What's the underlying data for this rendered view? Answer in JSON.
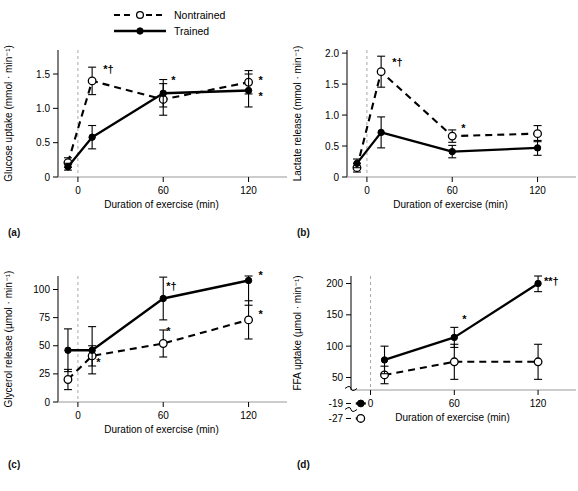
{
  "figure": {
    "legend": {
      "entries": [
        {
          "label": "Nontrained",
          "style": "dashed",
          "marker": "open-circle"
        },
        {
          "label": "Trained",
          "style": "solid",
          "marker": "filled-circle"
        }
      ]
    },
    "panel_labels": {
      "a": "(a)",
      "b": "(b)",
      "c": "(c)",
      "d": "(d)"
    }
  },
  "chart_data": [
    {
      "id": "a",
      "type": "line",
      "title": "",
      "xlabel": "Duration of exercise (min)",
      "ylabel": "Glucose uptake (mmol · min⁻¹)",
      "xticks": [
        0,
        60,
        120
      ],
      "xticklabels": [
        "0",
        "60",
        "120"
      ],
      "yticks": [
        0,
        0.5,
        1.0,
        1.5
      ],
      "yticklabels": [
        "0",
        "0.5",
        "1.0",
        "1.5"
      ],
      "ylim": [
        0,
        1.85
      ],
      "xlim": [
        -14,
        140
      ],
      "grid": false,
      "legend_position": "top-center-figure",
      "series": [
        {
          "name": "Nontrained",
          "style": "dashed",
          "marker": "open-circle",
          "x": [
            -7,
            10,
            60,
            120
          ],
          "values": [
            0.21,
            1.4,
            1.13,
            1.38
          ],
          "err": [
            0.07,
            0.2,
            0.23,
            0.17
          ]
        },
        {
          "name": "Trained",
          "style": "solid",
          "marker": "filled-circle",
          "x": [
            -7,
            10,
            60,
            120
          ],
          "values": [
            0.15,
            0.58,
            1.22,
            1.26
          ],
          "err": [
            0.05,
            0.17,
            0.2,
            0.24
          ]
        }
      ],
      "annotations": [
        {
          "text": "*†",
          "x": 10,
          "y": 1.4,
          "dx": 11,
          "dy": -8
        },
        {
          "text": "*",
          "x": 60,
          "y": 1.22,
          "dx": 8,
          "dy": -9
        },
        {
          "text": "*",
          "x": 120,
          "y": 1.38,
          "dx": 10,
          "dy": 2
        },
        {
          "text": "*",
          "x": 120,
          "y": 1.26,
          "dx": 10,
          "dy": 9
        }
      ]
    },
    {
      "id": "b",
      "type": "line",
      "title": "",
      "xlabel": "Duration of exercise (min)",
      "ylabel": "Lactate release (mmol · min⁻¹)",
      "xticks": [
        0,
        60,
        120
      ],
      "xticklabels": [
        "0",
        "60",
        "120"
      ],
      "yticks": [
        0,
        0.5,
        1.0,
        1.5,
        2.0
      ],
      "yticklabels": [
        "0",
        "0.5",
        "1.0",
        "1.5",
        "2.0"
      ],
      "ylim": [
        0,
        2.05
      ],
      "xlim": [
        -14,
        140
      ],
      "grid": false,
      "series": [
        {
          "name": "Nontrained",
          "style": "dashed",
          "marker": "open-circle",
          "x": [
            -7,
            10,
            60,
            120
          ],
          "values": [
            0.15,
            1.7,
            0.66,
            0.7
          ],
          "err": [
            0.07,
            0.25,
            0.1,
            0.13
          ]
        },
        {
          "name": "Trained",
          "style": "solid",
          "marker": "filled-circle",
          "x": [
            -7,
            10,
            60,
            120
          ],
          "values": [
            0.22,
            0.72,
            0.41,
            0.47
          ],
          "err": [
            0.07,
            0.25,
            0.1,
            0.12
          ]
        }
      ],
      "annotations": [
        {
          "text": "*†",
          "x": 10,
          "y": 1.7,
          "dx": 11,
          "dy": -6
        },
        {
          "text": "*",
          "x": 60,
          "y": 0.66,
          "dx": 9,
          "dy": -4
        }
      ]
    },
    {
      "id": "c",
      "type": "line",
      "title": "",
      "xlabel": "Duration of exercise (min)",
      "ylabel": "Glycerol release (µmol · min⁻¹)",
      "xticks": [
        0,
        60,
        120
      ],
      "xticklabels": [
        "0",
        "60",
        "120"
      ],
      "yticks": [
        0,
        25,
        50,
        75,
        100
      ],
      "yticklabels": [
        "0",
        "25",
        "50",
        "75",
        "100"
      ],
      "ylim": [
        0,
        112
      ],
      "xlim": [
        -14,
        140
      ],
      "grid": false,
      "series": [
        {
          "name": "Nontrained",
          "style": "dashed",
          "marker": "open-circle",
          "x": [
            -7,
            10,
            60,
            120
          ],
          "values": [
            20,
            41,
            52,
            73
          ],
          "err": [
            9,
            9,
            12,
            17
          ]
        },
        {
          "name": "Trained",
          "style": "solid",
          "marker": "filled-circle",
          "x": [
            -7,
            10,
            60,
            120
          ],
          "values": [
            46,
            46,
            92,
            108
          ],
          "err": [
            19,
            21,
            19,
            22
          ]
        }
      ],
      "annotations": [
        {
          "text": "*",
          "x": 10,
          "y": 41,
          "dx": 4,
          "dy": 10
        },
        {
          "text": "*†",
          "x": 60,
          "y": 92,
          "dx": 3,
          "dy": -9
        },
        {
          "text": "*",
          "x": 60,
          "y": 52,
          "dx": 3,
          "dy": -9
        },
        {
          "text": "*",
          "x": 120,
          "y": 108,
          "dx": 10,
          "dy": -2
        },
        {
          "text": "*",
          "x": 120,
          "y": 73,
          "dx": 10,
          "dy": -2
        }
      ]
    },
    {
      "id": "d",
      "type": "line",
      "title": "",
      "xlabel": "Duration of exercise (min)",
      "ylabel": "FFA uptake (µmol · min⁻¹)",
      "xticks": [
        0,
        60,
        120
      ],
      "xticklabels": [
        "0",
        "60",
        "120"
      ],
      "yticks": [
        50,
        100,
        150,
        200
      ],
      "yticklabels": [
        "50",
        "100",
        "150",
        "200"
      ],
      "broken_axis": true,
      "broken_ticks": [
        {
          "label": "-19",
          "value": -19
        },
        {
          "label": "-27",
          "value": -27
        }
      ],
      "ylim": [
        30,
        212
      ],
      "xlim": [
        -14,
        140
      ],
      "grid": false,
      "series": [
        {
          "name": "Nontrained",
          "style": "dashed",
          "marker": "open-circle",
          "x": [
            10,
            60,
            120
          ],
          "values": [
            54,
            75,
            75
          ],
          "err": [
            14,
            28,
            28
          ]
        },
        {
          "name": "Trained",
          "style": "solid",
          "marker": "filled-circle",
          "x": [
            10,
            60,
            120
          ],
          "values": [
            78,
            114,
            200
          ],
          "err": [
            22,
            16,
            13
          ]
        }
      ],
      "basal": [
        {
          "name": "Trained",
          "marker": "filled-circle",
          "label": "-19"
        },
        {
          "name": "Nontrained",
          "marker": "open-circle",
          "label": "-27"
        }
      ],
      "annotations": [
        {
          "text": "*",
          "x": 60,
          "y": 114,
          "dx": 8,
          "dy": -14
        },
        {
          "text": "**†",
          "x": 120,
          "y": 200,
          "dx": 6,
          "dy": 1
        }
      ]
    }
  ]
}
